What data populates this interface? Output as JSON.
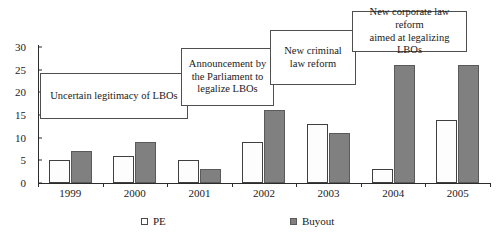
{
  "chart_data": {
    "type": "bar",
    "title": "",
    "xlabel": "",
    "ylabel": "",
    "categories": [
      "1999",
      "2000",
      "2001",
      "2002",
      "2003",
      "2004",
      "2005"
    ],
    "series": [
      {
        "name": "PE",
        "values": [
          5,
          6,
          5,
          9,
          13,
          3,
          14
        ],
        "color": "#ffffff"
      },
      {
        "name": "Buyout",
        "values": [
          7,
          9,
          3,
          16,
          11,
          26,
          26
        ],
        "color": "#808080"
      }
    ],
    "ylim": [
      0,
      30
    ],
    "yticks": [
      0,
      5,
      10,
      15,
      20,
      25,
      30
    ],
    "ytick_labels": [
      "0",
      "5",
      "10",
      "15",
      "20",
      "25",
      "30"
    ],
    "grid": false,
    "legend_position": "bottom",
    "annotations": [
      {
        "id": "annotation-uncertain-legitimacy",
        "text": "Uncertain legitimacy of LBOs",
        "x": 40,
        "y": 73,
        "w": 148,
        "h": 46
      },
      {
        "id": "annotation-parliament-announcement",
        "text": "Announcement by\nthe Parliament to\nlegalize LBOs",
        "x": 181,
        "y": 48,
        "w": 93,
        "h": 58
      },
      {
        "id": "annotation-criminal-law-reform",
        "text": "New criminal\nlaw reform",
        "x": 270,
        "y": 30,
        "w": 86,
        "h": 55
      },
      {
        "id": "annotation-corporate-law-reform",
        "text": "New corporate law reform\naimed at legalizing LBOs",
        "x": 352,
        "y": 11,
        "w": 115,
        "h": 41
      }
    ]
  },
  "legend": {
    "entries": [
      {
        "label": "PE",
        "swatch": "pe-swatch",
        "left": 141
      },
      {
        "label": "Buyout",
        "swatch": "buyout-swatch",
        "left": 290
      }
    ]
  }
}
